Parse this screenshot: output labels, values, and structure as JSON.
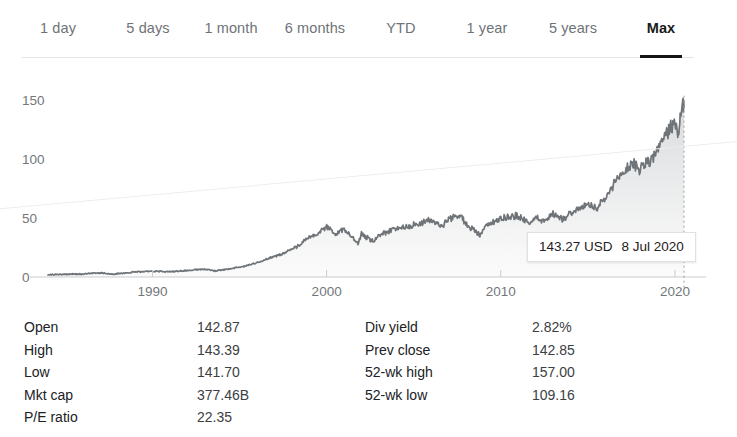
{
  "range_tabs": {
    "items": [
      {
        "label": "1 day",
        "active": false,
        "x": 58
      },
      {
        "label": "5 days",
        "active": false,
        "x": 148
      },
      {
        "label": "1 month",
        "active": false,
        "x": 231
      },
      {
        "label": "6 months",
        "active": false,
        "x": 315
      },
      {
        "label": "YTD",
        "active": false,
        "x": 401
      },
      {
        "label": "1 year",
        "active": false,
        "x": 487
      },
      {
        "label": "5 years",
        "active": false,
        "x": 573
      },
      {
        "label": "Max",
        "active": true,
        "x": 661
      }
    ],
    "active_index": 7
  },
  "tooltip": {
    "price": "143.27 USD",
    "date": "8 Jul 2020"
  },
  "colors": {
    "line": "#6f7478",
    "area_top": "#d8dadc",
    "area_bottom": "#f4f5f5",
    "axis": "#c9cbcd",
    "tick_text": "#72777b",
    "tab_inactive": "#6e7377",
    "tab_active": "#1a1a1a",
    "underline": "#141414"
  },
  "stats": {
    "left": [
      {
        "label": "Open",
        "value": "142.87"
      },
      {
        "label": "High",
        "value": "143.39"
      },
      {
        "label": "Low",
        "value": "141.70"
      },
      {
        "label": "Mkt cap",
        "value": "377.46B"
      },
      {
        "label": "P/E ratio",
        "value": "22.35"
      }
    ],
    "right": [
      {
        "label": "Div yield",
        "value": "2.82%"
      },
      {
        "label": "Prev close",
        "value": "142.85"
      },
      {
        "label": "52-wk high",
        "value": "157.00"
      },
      {
        "label": "52-wk low",
        "value": "109.16"
      }
    ]
  },
  "chart_data": {
    "type": "line",
    "title": "",
    "xlabel": "",
    "ylabel": "",
    "grid": false,
    "legend": null,
    "area_fill": true,
    "xlim": [
      1984.0,
      2020.52
    ],
    "ylim": [
      0,
      165
    ],
    "xticks": [
      1990,
      2000,
      2010,
      2020
    ],
    "xticklabels": [
      "1990",
      "2000",
      "2010",
      "2020"
    ],
    "yticks": [
      0,
      50,
      100,
      150
    ],
    "yticklabels": [
      "0",
      "50",
      "100",
      "150"
    ],
    "annotations": [
      {
        "kind": "cursor-line",
        "x": 2020.52,
        "style": "dotted"
      },
      {
        "kind": "tooltip",
        "text": "143.27 USD  8 Jul 2020",
        "x": 2020.52,
        "y": 143.27
      }
    ],
    "series": [
      {
        "name": "Price",
        "unit": "USD",
        "x": [
          1984.0,
          1985.0,
          1986.0,
          1987.0,
          1987.7,
          1988.0,
          1989.0,
          1990.0,
          1991.0,
          1992.0,
          1993.0,
          1993.6,
          1994.0,
          1995.0,
          1996.0,
          1997.0,
          1998.0,
          1999.0,
          1999.6,
          2000.0,
          2000.5,
          2001.0,
          2001.8,
          2002.0,
          2002.7,
          2003.0,
          2004.0,
          2005.0,
          2006.0,
          2006.6,
          2007.0,
          2007.7,
          2008.0,
          2008.8,
          2009.0,
          2009.6,
          2010.0,
          2011.0,
          2011.6,
          2012.0,
          2012.6,
          2013.0,
          2013.6,
          2014.0,
          2014.6,
          2015.0,
          2015.5,
          2016.0,
          2016.5,
          2017.0,
          2017.5,
          2018.0,
          2018.6,
          2019.0,
          2019.4,
          2019.8,
          2020.0,
          2020.2,
          2020.3,
          2020.45,
          2020.52
        ],
        "y": [
          2.0,
          2.2,
          2.6,
          3.6,
          2.4,
          2.8,
          4.2,
          5.0,
          4.4,
          5.6,
          6.6,
          5.2,
          6.0,
          8.2,
          12.0,
          17.5,
          23.0,
          33.0,
          38.0,
          43.0,
          36.0,
          41.0,
          28.0,
          36.0,
          30.0,
          35.0,
          41.0,
          44.0,
          48.0,
          43.0,
          49.0,
          52.0,
          45.0,
          36.0,
          41.0,
          47.0,
          50.0,
          52.0,
          45.0,
          51.0,
          47.0,
          54.0,
          49.0,
          55.0,
          58.0,
          62.0,
          57.0,
          66.0,
          78.0,
          88.0,
          96.0,
          92.0,
          99.0,
          108.0,
          118.0,
          127.0,
          133.0,
          118.0,
          138.0,
          146.0,
          143.27
        ]
      }
    ],
    "last_value": 143.27,
    "last_date": "8 Jul 2020"
  }
}
